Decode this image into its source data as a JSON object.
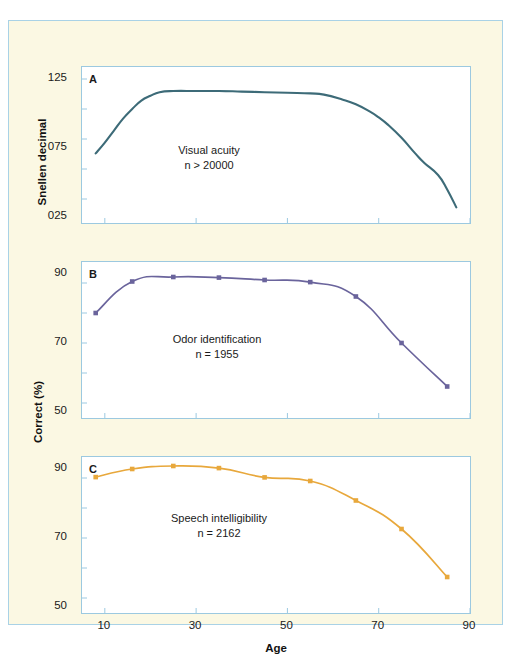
{
  "figure": {
    "background_color": "#fbf8e3",
    "border_color": "#a9d2e6",
    "axis_x_title": "Age",
    "axis_y_title_top": "Snellen decimal",
    "axis_y_title_bottom": "Correct (%)",
    "x_ticks": [
      "10",
      "30",
      "50",
      "70",
      "90"
    ]
  },
  "chart_data": [
    {
      "type": "line",
      "panel": "A",
      "title": "Visual acuity",
      "annotation_line1": "Visual acuity",
      "annotation_line2": "n > 20000",
      "xlabel": "Age",
      "ylabel": "Snellen decimal",
      "color": "#3d6b78",
      "markers": false,
      "grid": false,
      "xlim": [
        5,
        90
      ],
      "ylim": [
        0.05,
        1.35
      ],
      "xticks": [
        10,
        30,
        50,
        70,
        90
      ],
      "yticks": [
        0.25,
        0.75,
        1.25
      ],
      "ytick_labels": [
        "025",
        "075",
        "125"
      ],
      "x": [
        8,
        10,
        12,
        14,
        16,
        18,
        20,
        22,
        25,
        30,
        35,
        40,
        45,
        50,
        55,
        58,
        62,
        65,
        68,
        70,
        72,
        75,
        78,
        80,
        83,
        85,
        87
      ],
      "y": [
        0.63,
        0.72,
        0.82,
        0.92,
        1.0,
        1.07,
        1.11,
        1.14,
        1.15,
        1.15,
        1.15,
        1.145,
        1.14,
        1.135,
        1.13,
        1.12,
        1.08,
        1.04,
        0.98,
        0.93,
        0.87,
        0.76,
        0.63,
        0.55,
        0.45,
        0.33,
        0.18
      ]
    },
    {
      "type": "line",
      "panel": "B",
      "title": "Odor identification",
      "annotation_line1": "Odor identification",
      "annotation_line2": "n = 1955",
      "xlabel": "Age",
      "ylabel": "Correct (%)",
      "color": "#6a649c",
      "markers": true,
      "grid": false,
      "xlim": [
        5,
        90
      ],
      "ylim": [
        45,
        97
      ],
      "xticks": [
        10,
        30,
        50,
        70,
        90
      ],
      "yticks": [
        50,
        70,
        90
      ],
      "ytick_labels": [
        "50",
        "70",
        "90"
      ],
      "x": [
        8,
        16,
        25,
        35,
        45,
        55,
        65,
        75,
        85
      ],
      "y": [
        80.0,
        90.5,
        92.0,
        91.8,
        91.0,
        90.3,
        85.5,
        70.0,
        55.5
      ]
    },
    {
      "type": "line",
      "panel": "C",
      "title": "Speech intelligibility",
      "annotation_line1": "Speech intelligibility",
      "annotation_line2": "n = 2162",
      "xlabel": "Age",
      "ylabel": "Correct (%)",
      "color": "#e8a83c",
      "markers": true,
      "grid": false,
      "xlim": [
        5,
        90
      ],
      "ylim": [
        45,
        97
      ],
      "xticks": [
        10,
        30,
        50,
        70,
        90
      ],
      "yticks": [
        50,
        70,
        90
      ],
      "ytick_labels": [
        "50",
        "70",
        "90"
      ],
      "x": [
        8,
        16,
        25,
        35,
        45,
        55,
        65,
        75,
        85
      ],
      "y": [
        90.3,
        93.0,
        94.0,
        93.3,
        90.2,
        89.0,
        82.5,
        73.0,
        57.0
      ]
    }
  ]
}
